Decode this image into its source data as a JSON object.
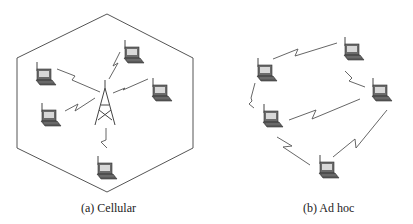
{
  "figure": {
    "panels": [
      {
        "id": "a",
        "caption": "(a) Cellular",
        "shape": "hexagon-cell",
        "nodes": 5,
        "base_station": "cell-tower-icon"
      },
      {
        "id": "b",
        "caption": "(b) Ad hoc",
        "nodes": 5,
        "base_station": null
      }
    ],
    "colors": {
      "line": "#555555",
      "laptop_body": "#6b6b6b",
      "laptop_screen": "#d8d8d8"
    }
  }
}
